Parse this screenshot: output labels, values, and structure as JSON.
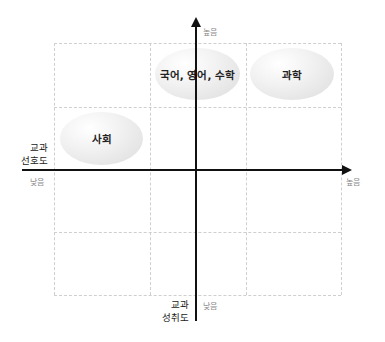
{
  "diagram": {
    "type": "quadrant-matrix",
    "x_axis": {
      "title_line1": "교과",
      "title_line2": "선호도",
      "low_label": "낮음",
      "high_label": "높음"
    },
    "y_axis": {
      "title_line1": "교과",
      "title_line2": "성취도",
      "low_label": "낮음",
      "high_label": "높음"
    },
    "items": [
      {
        "label": "국어, 영어, 수학",
        "preference": "medium-high",
        "achievement": "high"
      },
      {
        "label": "과학",
        "preference": "high",
        "achievement": "high"
      },
      {
        "label": "사회",
        "preference": "low",
        "achievement": "medium-high"
      }
    ],
    "grid": {
      "columns": 3,
      "rows": 4,
      "style": "dashed"
    },
    "colors": {
      "axis": "#111111",
      "grid": "#cfcfcf",
      "bubble": "#e6e6e6",
      "tick_label": "#8a8a8a"
    }
  }
}
